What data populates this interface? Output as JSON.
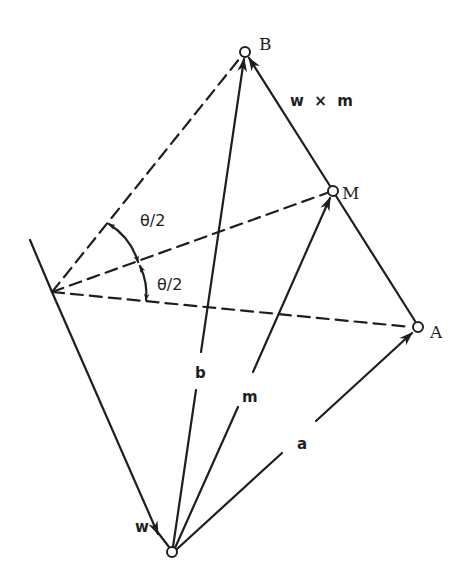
{
  "figure": {
    "type": "vector-geometry-diagram",
    "colors": {
      "ink": "#1e1e1e",
      "background": "#ffffff"
    }
  },
  "points": {
    "O": {
      "label": "",
      "x": 172,
      "y": 552
    },
    "A": {
      "label": "A",
      "x": 418,
      "y": 327
    },
    "M": {
      "label": "M",
      "x": 333,
      "y": 191
    },
    "B": {
      "label": "B",
      "x": 245,
      "y": 52
    },
    "P": {
      "label": "",
      "x": 52,
      "y": 292
    }
  },
  "vectors": {
    "a": {
      "label": "a",
      "from": "O",
      "to": "A"
    },
    "m": {
      "label": "m",
      "from": "O",
      "to": "M"
    },
    "b": {
      "label": "b",
      "from": "O",
      "to": "B"
    },
    "w": {
      "label": "w",
      "from": "P",
      "to": "O"
    },
    "wxm": {
      "label": "w  ×  m",
      "from": "M",
      "to": "B"
    }
  },
  "angles": {
    "upper": {
      "label": "θ/2"
    },
    "lower": {
      "label": "θ/2"
    }
  }
}
